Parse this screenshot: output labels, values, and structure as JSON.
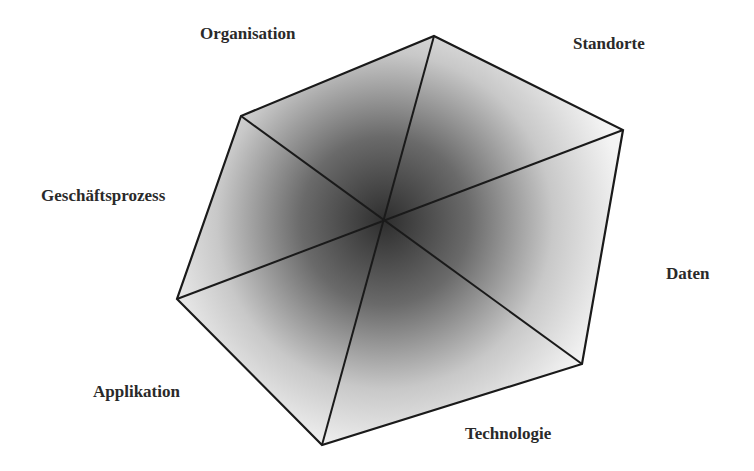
{
  "diagram": {
    "type": "hexagon-dimensions",
    "center": [
      385,
      221
    ],
    "colors": {
      "edge": "#1a1a1a",
      "fill_center": "#3a3a3a",
      "fill_outer": "#ffffff",
      "text": "#2a2a2a"
    },
    "vertices": [
      {
        "name": "organisation",
        "point": [
          434,
          36
        ]
      },
      {
        "name": "standorte",
        "point": [
          623,
          130
        ]
      },
      {
        "name": "daten",
        "point": [
          582,
          364
        ]
      },
      {
        "name": "technologie",
        "point": [
          322,
          445
        ]
      },
      {
        "name": "applikation",
        "point": [
          177,
          299
        ]
      },
      {
        "name": "geschaeftsprozess",
        "point": [
          241,
          116
        ]
      }
    ],
    "labels": {
      "organisation": "Organisation",
      "standorte": "Standorte",
      "daten": "Daten",
      "technologie": "Technologie",
      "applikation": "Applikation",
      "geschaeftsprozess": "Geschäftsprozess"
    }
  }
}
